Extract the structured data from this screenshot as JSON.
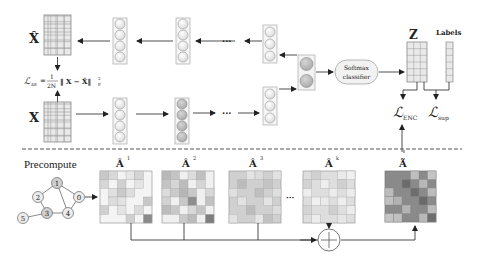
{
  "top": {
    "xhat_label": "X̂",
    "x_label": "X",
    "loss_ae": {
      "lhs": "ℒ",
      "lhs_sub": "AE",
      "eq": "=",
      "num": "1",
      "den": "2N",
      "body": "‖ X − X̂‖",
      "sup": "2",
      "sub": "F"
    },
    "ellipsis_top": "···",
    "ellipsis_bottom": "···",
    "softmax_line1": "Softmax",
    "softmax_line2": "classifier",
    "z_label": "Z",
    "labels_label": "Labels",
    "loss_enc": "ℒ",
    "loss_enc_sub": "ENC",
    "loss_sup": "ℒ",
    "loss_sup_sub": "sup"
  },
  "bottom": {
    "precompute_label": "Precompute",
    "graph_nodes": [
      "0",
      "1",
      "2",
      "3",
      "4",
      "5"
    ],
    "matrices": [
      {
        "label": "Â",
        "sup": "1"
      },
      {
        "label": "Â",
        "sup": "2"
      },
      {
        "label": "Â",
        "sup": "3"
      },
      {
        "label": "Â",
        "sup": "k"
      }
    ],
    "ellipsis": "···",
    "final_matrix": {
      "label": "Ã"
    },
    "sum_symbol": "+"
  },
  "colors": {
    "grid_light": "#e6e6e6",
    "grid_line": "#9a9a9a",
    "node_fill_light": "#ececec",
    "node_fill_dark": "#b8b8b8",
    "arrow": "#222222",
    "dash": "#555555"
  }
}
